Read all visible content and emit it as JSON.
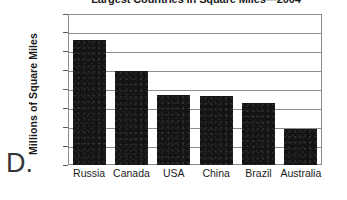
{
  "option_letter": "D.",
  "chart_data": {
    "type": "bar",
    "title": "Largest Countries in Square Miles—2004",
    "xlabel": "",
    "ylabel": "Millions of Square Miles",
    "ylim": [
      0,
      8
    ],
    "yticks": [
      "0",
      "1",
      "2",
      "3",
      "4",
      "5",
      "6",
      "7",
      "8"
    ],
    "grid": true,
    "legend": "none",
    "bar_color": "#141414",
    "categories": [
      "Russia",
      "Canada",
      "USA",
      "China",
      "Brazil",
      "Australia"
    ],
    "values": [
      6.6,
      5.0,
      3.7,
      3.65,
      3.3,
      1.9
    ]
  }
}
